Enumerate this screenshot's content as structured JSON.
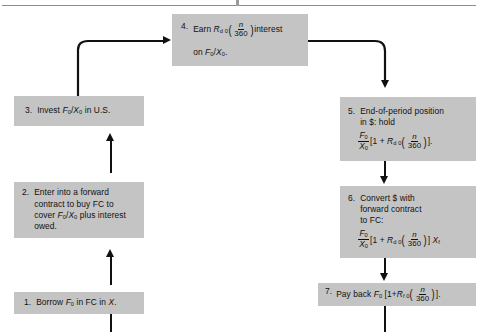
{
  "figure": {
    "type": "flowchart",
    "box_fill_color": "#c4c4c4",
    "line_color": "#111111",
    "page_background": "#ffffff"
  },
  "steps": [
    {
      "id": "step-1",
      "number": "1.",
      "lines": [
        "Borrow F0 in FC in X."
      ],
      "text_plain": "1. Borrow F₀ in FC in X."
    },
    {
      "id": "step-2",
      "number": "2.",
      "lines": [
        "Enter into a forward",
        "contract to buy FC to",
        "cover F0/X0 plus interest",
        "owed."
      ],
      "text_plain": "2. Enter into a forward contract to buy FC to cover F₀/X₀ plus interest owed."
    },
    {
      "id": "step-3",
      "number": "3.",
      "lines": [
        "Invest F0/X0 in U.S."
      ],
      "text_plain": "3. Invest F₀/X₀ in U.S."
    },
    {
      "id": "step-4",
      "number": "4.",
      "lines": [
        "Earn Rd0(n/360) interest",
        "on F0/X0."
      ],
      "text_plain": "4. Earn Rₐ₀(n/360) interest on F₀/X₀."
    },
    {
      "id": "step-5",
      "number": "5.",
      "lines": [
        "End-of-period position",
        "in $: hold",
        "F0/X0 [1 + Rd0(n/360)]."
      ],
      "text_plain": "5. End-of-period position in $: hold F₀/X₀ [1 + Rd₀(n/360)]."
    },
    {
      "id": "step-6",
      "number": "6.",
      "lines": [
        "Convert $ with",
        "forward contract",
        "to FC:",
        "F0/X0 [1 + Rd0(n/360)] Xf"
      ],
      "text_plain": "6. Convert $ with forward contract to FC: F₀/X₀ [1 + Rd₀(n/360)] Xf"
    },
    {
      "id": "step-7",
      "number": "7.",
      "lines": [
        "Pay back F0 [1+Rf0(n/360)]."
      ],
      "text_plain": "7. Pay back F₀ [1+Rf₀(n/360)]."
    }
  ],
  "symbols": {
    "F": "F",
    "X": "X",
    "R": "R",
    "n": "n",
    "denominator": "360",
    "sub_zero": "0",
    "sub_d0": "d 0",
    "sub_f0": "f 0",
    "sub_f": "f",
    "one": "1",
    "plus": "+",
    "bracket_open": "[",
    "bracket_close": "]",
    "period": ".",
    "slash": "/"
  },
  "labels": {
    "step1_borrow": "Borrow",
    "step1_in_fc_in": "in FC in",
    "step2_l1": "Enter into a forward",
    "step2_l2": "contract to buy FC to",
    "step2_l3_a": "cover",
    "step2_l3_b": "plus interest",
    "step2_l4": "owed.",
    "step3_invest": "Invest",
    "step3_in_us": "in U.S.",
    "step4_earn": "Earn",
    "step4_interest": "interest",
    "step4_on": "on",
    "step5_l1": "End-of-period position",
    "step5_l2": "in $: hold",
    "step6_l1": "Convert $ with",
    "step6_l2": "forward contract",
    "step6_l3": "to FC:",
    "step7_payback": "Pay back"
  },
  "connectors": [
    {
      "id": "conn-1-to-2",
      "from": "step-1",
      "to": "step-2",
      "direction": "up"
    },
    {
      "id": "conn-2-to-3",
      "from": "step-2",
      "to": "step-3",
      "direction": "up"
    },
    {
      "id": "conn-3-to-4",
      "from": "step-3",
      "to": "step-4",
      "direction": "up-then-right"
    },
    {
      "id": "conn-4-to-5",
      "from": "step-4",
      "to": "step-5",
      "direction": "right-then-down"
    },
    {
      "id": "conn-5-to-6",
      "from": "step-5",
      "to": "step-6",
      "direction": "down"
    },
    {
      "id": "conn-6-to-7",
      "from": "step-6",
      "to": "step-7",
      "direction": "down"
    },
    {
      "id": "conn-7-out",
      "from": "step-7",
      "to": "off-page",
      "direction": "down"
    },
    {
      "id": "conn-in-1",
      "from": "off-page",
      "to": "step-1",
      "direction": "up"
    }
  ]
}
